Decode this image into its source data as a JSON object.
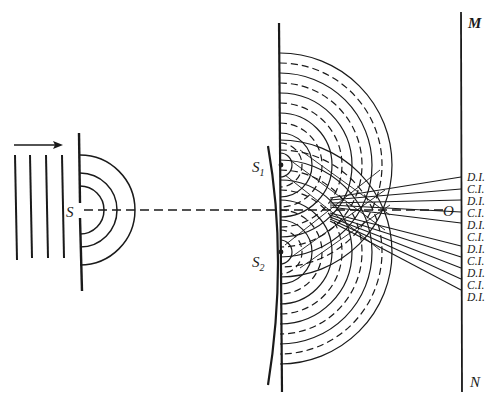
{
  "figure": {
    "labels": {
      "source": "S",
      "slit1": "S",
      "slit1_sub": "1",
      "slit2": "S",
      "slit2_sub": "2",
      "center": "O",
      "screen_top": "M",
      "screen_bottom": "N"
    },
    "fringe_labels": [
      "D.I.",
      "C.I.",
      "D.I.",
      "C.I.",
      "D.I.",
      "C.I.",
      "D.I.",
      "C.I.",
      "D.I.",
      "C.I.",
      "D.I."
    ],
    "fringe_label_meaning": {
      "C.I.": "constructive interference",
      "D.I.": "destructive interference"
    },
    "colors": {
      "ink": "#1a1a1a",
      "background": "#ffffff"
    }
  }
}
